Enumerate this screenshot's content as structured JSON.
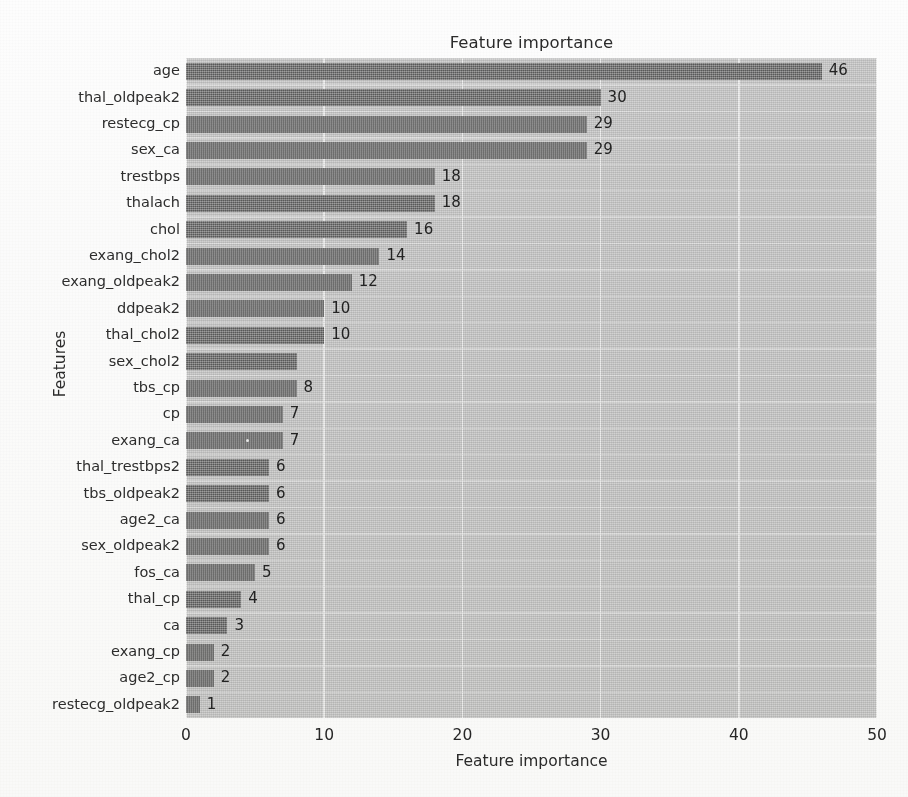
{
  "chart_data": {
    "type": "bar",
    "orientation": "horizontal",
    "title": "Feature importance",
    "xlabel": "Feature importance",
    "ylabel": "Features",
    "xlim": [
      0,
      50
    ],
    "xticks": [
      0,
      10,
      20,
      30,
      40,
      50
    ],
    "grid": true,
    "legend": "none",
    "bar_color": "#6d6d6d",
    "plot_background": "#c9c9c9",
    "gridline_color": "#f2f2f2",
    "categories": [
      "age",
      "thal_oldpeak2",
      "restecg_cp",
      "sex_ca",
      "trestbps",
      "thalach",
      "chol",
      "exang_chol2",
      "exang_oldpeak2",
      "ddpeak2",
      "thal_chol2",
      "sex_chol2",
      "tbs_cp",
      "cp",
      "exang_ca",
      "thal_trestbps2",
      "tbs_oldpeak2",
      "age2_ca",
      "sex_oldpeak2",
      "fos_ca",
      "thal_cp",
      "ca",
      "exang_cp",
      "age2_cp",
      "restecg_oldpeak2"
    ],
    "values": [
      46,
      30,
      29,
      29,
      18,
      18,
      16,
      14,
      12,
      10,
      10,
      8,
      8,
      7,
      7,
      6,
      6,
      6,
      6,
      5,
      4,
      3,
      2,
      2,
      1
    ],
    "value_labels": [
      "46",
      "30",
      "29",
      "29",
      "18",
      "18",
      "16",
      "14",
      "12",
      "10",
      "10",
      "",
      "8",
      "7",
      "7",
      "6",
      "6",
      "6",
      "6",
      "5",
      "4",
      "3",
      "2",
      "2",
      "1"
    ]
  }
}
